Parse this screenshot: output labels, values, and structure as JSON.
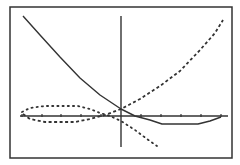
{
  "chart_data": {
    "type": "line",
    "title": "",
    "xlabel": "",
    "ylabel": "",
    "grid": false,
    "legend": null,
    "frame": {
      "left": 10,
      "top": 7,
      "right": 232,
      "bottom": 158,
      "stroke": "#333333"
    },
    "axes": {
      "origin_px": [
        121,
        116
      ],
      "x_axis": {
        "y": 116,
        "x_from": 20,
        "x_to": 228
      },
      "y_axis": {
        "x": 121,
        "y_from": 16,
        "y_to": 147
      },
      "x_ticks_px": [
        22,
        42,
        61,
        81,
        101,
        141,
        161,
        181,
        201,
        221
      ],
      "color": "#333333"
    },
    "series": [
      {
        "name": "solid-curve",
        "style": "solid",
        "color": "#333333",
        "points_px": [
          [
            23,
            16
          ],
          [
            40,
            35
          ],
          [
            60,
            57
          ],
          [
            80,
            78
          ],
          [
            100,
            95
          ],
          [
            121,
            109
          ],
          [
            135,
            116
          ],
          [
            150,
            120
          ],
          [
            162,
            124
          ],
          [
            198,
            124
          ],
          [
            210,
            121
          ],
          [
            221,
            117
          ]
        ]
      },
      {
        "name": "dashed-curve",
        "style": "dashed",
        "color": "#333333",
        "points_px": [
          [
            23,
            114
          ],
          [
            30,
            119
          ],
          [
            45,
            122
          ],
          [
            75,
            122
          ],
          [
            90,
            119
          ],
          [
            105,
            115
          ],
          [
            121,
            109
          ],
          [
            140,
            99
          ],
          [
            160,
            86
          ],
          [
            180,
            71
          ],
          [
            200,
            50
          ],
          [
            215,
            33
          ],
          [
            223,
            20
          ]
        ]
      },
      {
        "name": "dotted-curve",
        "style": "dotted",
        "color": "#333333",
        "points_px": [
          [
            22,
            112
          ],
          [
            30,
            108
          ],
          [
            45,
            106
          ],
          [
            78,
            106
          ],
          [
            90,
            109
          ],
          [
            100,
            113
          ],
          [
            110,
            116
          ],
          [
            121,
            121
          ],
          [
            135,
            130
          ],
          [
            147,
            139
          ],
          [
            157,
            146
          ]
        ]
      }
    ]
  }
}
